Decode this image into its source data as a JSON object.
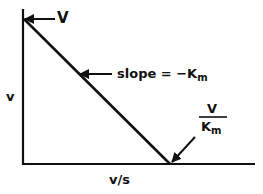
{
  "diagram": {
    "axes": {
      "y_label": "v",
      "x_label": "v/s"
    },
    "annotations": {
      "y_intercept": "V",
      "slope_prefix": "slope = −K",
      "slope_sub": "m",
      "x_intercept_numerator": "V",
      "x_intercept_denominator": "K",
      "x_intercept_denominator_sub": "m"
    },
    "colors": {
      "ink": "#111111",
      "background": "#ffffff"
    }
  }
}
